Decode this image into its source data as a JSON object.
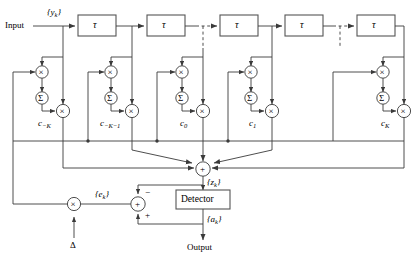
{
  "diagram": {
    "type": "block-diagram",
    "colors": {
      "line": "#3a3a3a",
      "box_border": "#555555",
      "background": "#ffffff",
      "text": "#000000"
    },
    "io": {
      "input_label": "Input",
      "output_label": "Output",
      "input_signal": "{y",
      "input_signal_sub": "k",
      "input_signal_close": "}"
    },
    "delay_boxes": [
      {
        "label": "τ",
        "name": "delay-1"
      },
      {
        "label": "τ",
        "name": "delay-2"
      },
      {
        "label": "τ",
        "name": "delay-3"
      },
      {
        "label": "τ",
        "name": "delay-4"
      },
      {
        "label": "τ",
        "name": "delay-5"
      }
    ],
    "taps": [
      {
        "coef": "c",
        "coef_sub": "−K",
        "name": "tap-minus-k"
      },
      {
        "coef": "c",
        "coef_sub": "−K−1",
        "name": "tap-minus-k-1"
      },
      {
        "coef": "c",
        "coef_sub": "0",
        "name": "tap-zero"
      },
      {
        "coef": "c",
        "coef_sub": "1",
        "name": "tap-one"
      },
      {
        "coef": "c",
        "coef_sub": "K",
        "name": "tap-k"
      }
    ],
    "nodes": {
      "multiply_glyph": "×",
      "sum_glyph": "Σ",
      "adder_glyph": "+",
      "detector_label": "Detector",
      "step_size": "Δ"
    },
    "signals": {
      "z": "{z",
      "z_sub": "k",
      "z_close": "}",
      "a": "{a",
      "a_sub": "k",
      "a_close": "}",
      "e": "{e",
      "e_sub": "k",
      "e_close": "}"
    },
    "error_junction": {
      "minus_sign": "−",
      "plus_sign": "+"
    }
  }
}
